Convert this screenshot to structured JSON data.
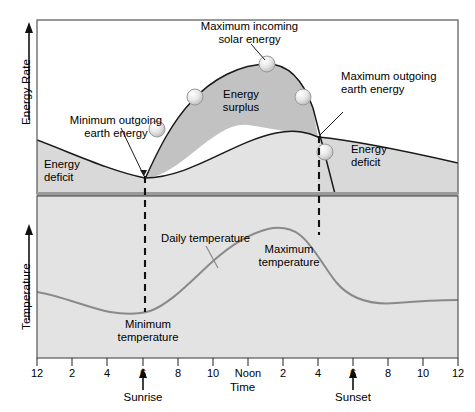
{
  "figure": {
    "type": "line",
    "title": "",
    "xlabel": "Time",
    "ylabel_top": "Energy Rate",
    "ylabel_bottom": "Temperature",
    "xticks": [
      "12",
      "2",
      "4",
      "6",
      "8",
      "10",
      "Noon",
      "2",
      "4",
      "6",
      "8",
      "10",
      "12"
    ],
    "grid": false,
    "legend": "none"
  },
  "labels": {
    "max_incoming": "Maximum incoming\nsolar energy",
    "max_incoming_l1": "Maximum incoming",
    "max_incoming_l2": "solar energy",
    "min_outgoing_l1": "Minimum outgoing",
    "min_outgoing_l2": "earth energy",
    "max_outgoing_l1": "Maximum outgoing",
    "max_outgoing_l2": "earth energy",
    "energy_surplus_l1": "Energy",
    "energy_surplus_l2": "surplus",
    "energy_deficit_left_l1": "Energy",
    "energy_deficit_left_l2": "deficit",
    "energy_deficit_right_l1": "Energy",
    "energy_deficit_right_l2": "deficit",
    "daily_temperature": "Daily temperature",
    "minimum_temperature_l1": "Minimum",
    "minimum_temperature_l2": "temperature",
    "maximum_temperature_l1": "Maximum",
    "maximum_temperature_l2": "temperature",
    "sunrise": "Sunrise",
    "sunset": "Sunset",
    "time": "Time",
    "energy_rate": "Energy Rate",
    "temperature": "Temperature"
  },
  "colors": {
    "panel_fill": "#e8e8e8",
    "surplus_fill": "#c4c4c4",
    "deficit_fill": "#d6d6d6",
    "curve_dark": "#1a1a1a",
    "curve_gray": "#8a8a8a",
    "divider": "#9a9a9a",
    "frame": "#555555",
    "white": "#ffffff",
    "sphere": "#d9d9d9"
  },
  "chart_data": {
    "type": "line",
    "title": "",
    "xlabel": "Time",
    "ylabel": "Energy Rate / Temperature",
    "x": [
      0,
      2,
      4,
      6,
      8,
      10,
      12,
      14,
      16,
      18,
      20,
      22,
      24
    ],
    "xticklabels": [
      "12",
      "2",
      "4",
      "6",
      "8",
      "10",
      "Noon",
      "2",
      "4",
      "6",
      "8",
      "10",
      "12"
    ],
    "xlim": [
      0,
      24
    ],
    "grid": false,
    "panels": [
      {
        "name": "energy-rate-panel",
        "ylabel": "Energy Rate",
        "series": [
          {
            "name": "Incoming solar energy",
            "x": [
              6.2,
              7,
              8,
              9,
              10,
              11,
              12,
              13,
              14,
              15,
              16,
              16.6,
              17.2
            ],
            "values": [
              0.0,
              0.18,
              0.4,
              0.6,
              0.76,
              0.86,
              0.9,
              0.87,
              0.78,
              0.62,
              0.38,
              0.2,
              0.02
            ],
            "style": "solid-dark"
          },
          {
            "name": "Outgoing earth energy",
            "x": [
              0,
              2,
              4,
              6,
              8,
              10,
              12,
              14,
              16,
              16.6,
              18,
              20,
              22,
              24
            ],
            "values": [
              0.3,
              0.22,
              0.13,
              0.05,
              0.1,
              0.18,
              0.27,
              0.34,
              0.39,
              0.4,
              0.38,
              0.34,
              0.3,
              0.27
            ],
            "style": "solid-dark"
          }
        ],
        "annotations": [
          {
            "text": "Maximum incoming solar energy",
            "x": 12,
            "y": 0.9
          },
          {
            "text": "Minimum outgoing earth energy",
            "x": 6.2,
            "y": 0.05
          },
          {
            "text": "Maximum outgoing earth energy",
            "x": 16.6,
            "y": 0.4
          },
          {
            "text": "Energy surplus",
            "x": 11.5,
            "y": 0.55
          },
          {
            "text": "Energy deficit",
            "x": 2.5,
            "y": 0.12
          },
          {
            "text": "Energy deficit",
            "x": 19.5,
            "y": 0.25
          }
        ],
        "markers": [
          {
            "label": "sphere",
            "x": 7.6,
            "y": 0.3
          },
          {
            "label": "sphere",
            "x": 9.8,
            "y": 0.74
          },
          {
            "label": "sphere",
            "x": 14.5,
            "y": 0.74
          },
          {
            "label": "sphere",
            "x": 16.2,
            "y": 0.3
          }
        ]
      },
      {
        "name": "temperature-panel",
        "ylabel": "Temperature",
        "series": [
          {
            "name": "Daily temperature",
            "x": [
              0,
              2,
              4,
              6,
              6.2,
              8,
              10,
              12,
              14,
              16,
              16.4,
              18,
              20,
              22,
              24
            ],
            "values": [
              0.42,
              0.36,
              0.28,
              0.24,
              0.24,
              0.34,
              0.52,
              0.68,
              0.78,
              0.82,
              0.82,
              0.62,
              0.46,
              0.42,
              0.42
            ],
            "style": "solid-gray"
          }
        ],
        "annotations": [
          {
            "text": "Daily temperature",
            "x": 9.0,
            "y": 0.7
          },
          {
            "text": "Minimum temperature",
            "x": 6.2,
            "y": 0.12
          },
          {
            "text": "Maximum temperature",
            "x": 14.0,
            "y": 0.62
          }
        ]
      }
    ],
    "event_markers": [
      {
        "label": "Sunrise",
        "x": 6.2
      },
      {
        "label": "Sunset",
        "x": 18.0
      }
    ],
    "vertical_guides": [
      {
        "label": "sunrise-guide",
        "x": 6.2,
        "style": "dashed"
      },
      {
        "label": "sunset-guide",
        "x": 16.55,
        "style": "dashed"
      }
    ]
  }
}
